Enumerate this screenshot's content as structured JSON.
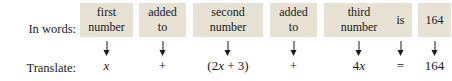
{
  "labels": {
    "words_row": "In words:",
    "translate_row": "Translate:"
  },
  "colors": {
    "box_background": "#e7e2d4",
    "text": "#181818",
    "page_background": "#ffffff"
  },
  "columns": [
    {
      "id": "first-number",
      "words_line1": "first",
      "words_line2": "number",
      "expression": "x",
      "expression_parts": [
        {
          "text": "x",
          "italic": true
        }
      ],
      "arrow": "down-arrow",
      "left": 0,
      "width": 53
    },
    {
      "id": "added-to-1",
      "words_line1": "added",
      "words_line2": "to",
      "expression": "+",
      "expression_parts": [
        {
          "text": "+",
          "italic": false
        }
      ],
      "arrow": "down-arrow",
      "left": 59,
      "width": 47
    },
    {
      "id": "second-number",
      "words_line1": "second",
      "words_line2": "number",
      "expression": "(2x + 3)",
      "expression_parts": [
        {
          "text": "(2",
          "italic": false
        },
        {
          "text": "x",
          "italic": true
        },
        {
          "text": " + 3)",
          "italic": false
        }
      ],
      "arrow": "down-arrow",
      "left": 113,
      "width": 70
    },
    {
      "id": "added-to-2",
      "words_line1": "added",
      "words_line2": "to",
      "expression": "+",
      "expression_parts": [
        {
          "text": "+",
          "italic": false
        }
      ],
      "arrow": "down-arrow",
      "left": 190,
      "width": 47
    },
    {
      "id": "third-number",
      "words_line1": "third",
      "words_line2": "number",
      "expression": "4x",
      "expression_parts": [
        {
          "text": "4",
          "italic": false
        },
        {
          "text": "x",
          "italic": true
        }
      ],
      "arrow": "down-arrow",
      "left": 244,
      "width": 70
    },
    {
      "id": "is",
      "words_line1": "is",
      "words_line2": "",
      "expression": "=",
      "expression_parts": [
        {
          "text": "=",
          "italic": false
        }
      ],
      "arrow": "down-arrow",
      "left": 309,
      "width": 23
    },
    {
      "id": "value-164",
      "words_line1": "164",
      "words_line2": "",
      "expression": "164",
      "expression_parts": [
        {
          "text": "164",
          "italic": false
        }
      ],
      "arrow": "down-arrow",
      "left": 338,
      "width": 33
    }
  ]
}
